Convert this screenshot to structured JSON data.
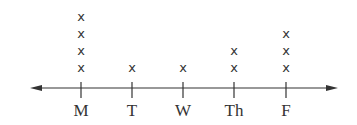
{
  "chart_data": {
    "type": "line plot",
    "categories": [
      "M",
      "T",
      "W",
      "Th",
      "F"
    ],
    "values": [
      4,
      1,
      1,
      2,
      3
    ],
    "marker": "x",
    "title": "",
    "xlabel": "",
    "ylabel": "",
    "axis": "number line with arrows at both ends",
    "grid": false
  }
}
